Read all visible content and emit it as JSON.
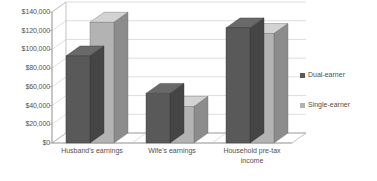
{
  "chart_data": {
    "type": "bar",
    "title": "",
    "subtitle": "",
    "xlabel": "",
    "ylabel": "",
    "categories": [
      "Husband's earnings",
      "Wife's earnings",
      "Household pre-tax\nincome"
    ],
    "series": [
      {
        "name": "Dual-earner",
        "color": "#595959",
        "values": [
          93000,
          53000,
          123000
        ]
      },
      {
        "name": "Single-earner",
        "color": "#b3b3b3",
        "values": [
          129000,
          39000,
          117000
        ]
      }
    ],
    "ylim": [
      0,
      140000
    ],
    "ytick_values": [
      0,
      20000,
      40000,
      60000,
      80000,
      100000,
      120000,
      140000
    ],
    "ytick_labels": [
      "$0",
      "$20,000",
      "$40,000",
      "$60,000",
      "$80,000",
      "$100,000",
      "$120,000",
      "$140,000"
    ],
    "grid": true,
    "grid_axis": "y",
    "legend_position": "right",
    "three_d": true,
    "background_color": "#ffffff",
    "grid_color": "#c8c8c8",
    "axis_color": "#9a9a9a",
    "text_color": "#4f4f4f"
  },
  "axis": {
    "y_labels": [
      "$140,000",
      "$120,000",
      "$100,000",
      "$80,000",
      "$60,000",
      "$40,000",
      "$20,000",
      "$0"
    ],
    "x_labels": [
      "Husband's earnings",
      "Wife's earnings",
      "Household pre-tax income"
    ]
  },
  "legend": {
    "items": [
      {
        "label": "Dual-earner",
        "color": "#595959"
      },
      {
        "label": "Single-earner",
        "color": "#b3b3b3"
      }
    ]
  }
}
